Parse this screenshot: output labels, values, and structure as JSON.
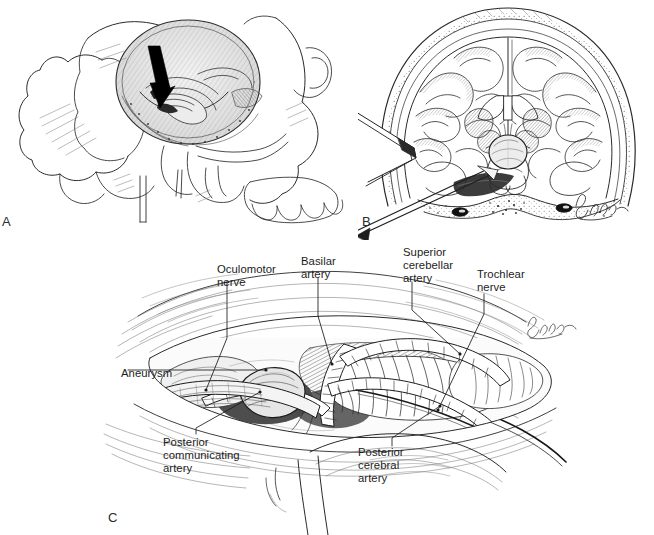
{
  "figure": {
    "type": "medical-surgical-illustration",
    "style": "pen-and-ink line drawing, black on white",
    "panel_count": 3,
    "background_color": "#ffffff",
    "ink_color": "#1a1a1a"
  },
  "panels": [
    {
      "letter": "A",
      "name": "lateral-skull-craniotomy",
      "description": "Lateral view of the skull with a subtemporal craniotomy window exposing the middle cranial fossa floor; a solid black arrow indicates the surgical trajectory toward the petrous apex."
    },
    {
      "letter": "B",
      "name": "coronal-brain-section-retraction",
      "description": "Coronal section of the brain within the skull showing temporal lobe retraction with a brain retractor blade and the aneurysm at the basilar apex in the interpeduncular cistern.",
      "signature": "Schenak"
    },
    {
      "letter": "C",
      "name": "operative-view-basilar-apex",
      "description": "Magnified operative view through the subtemporal corridor showing the neurovascular anatomy around the basilar apex aneurysm.",
      "signature": "Schenak"
    }
  ],
  "panel_letters": {
    "a": "A",
    "b": "B",
    "c": "C"
  },
  "labels": [
    {
      "id": "oculomotor-nerve",
      "text": "Oculomotor\nnerve",
      "x": 217,
      "y": 263
    },
    {
      "id": "basilar-artery",
      "text": "Basilar\nartery",
      "x": 301,
      "y": 255
    },
    {
      "id": "superior-cerebellar-artery",
      "text": "Superior\ncerebellar\nartery",
      "x": 403,
      "y": 246
    },
    {
      "id": "trochlear-nerve",
      "text": "Trochlear\nnerve",
      "x": 477,
      "y": 268
    },
    {
      "id": "aneurysm",
      "text": "Aneurysm",
      "x": 121,
      "y": 367
    },
    {
      "id": "posterior-communicating-artery",
      "text": "Posterior\ncommunicating\nartery",
      "x": 163,
      "y": 436
    },
    {
      "id": "posterior-cerebral-artery",
      "text": "Posterior\ncerebral\nartery",
      "x": 358,
      "y": 446
    }
  ],
  "label_text": {
    "oculomotor_nerve": "Oculomotor\nnerve",
    "basilar_artery": "Basilar\nartery",
    "superior_cerebellar_artery": "Superior\ncerebellar\nartery",
    "trochlear_nerve": "Trochlear\nnerve",
    "aneurysm": "Aneurysm",
    "posterior_communicating_artery": "Posterior\ncommunicating\nartery",
    "posterior_cerebral_artery": "Posterior\ncerebral\nartery"
  },
  "annotations": {
    "panel_a_arrow": "solid black arrow pointing down-right into the craniotomy window",
    "panel_b_retractor": "retractor blade and suction/instrument shafts entering from lower left",
    "artist_signature": "Schenak"
  },
  "caption_fragment": ""
}
